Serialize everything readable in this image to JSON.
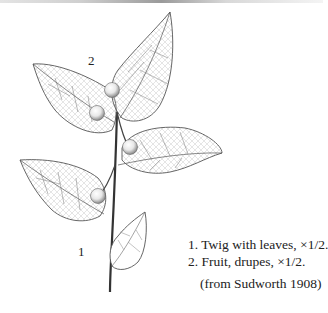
{
  "figure": {
    "labels": {
      "twig_number": "1",
      "fruit_number": "2"
    },
    "caption": {
      "line1": "1. Twig with leaves, ×1/2.",
      "line2": "2. Fruit, drupes, ×1/2."
    },
    "source": "(from Sudworth 1908)"
  }
}
